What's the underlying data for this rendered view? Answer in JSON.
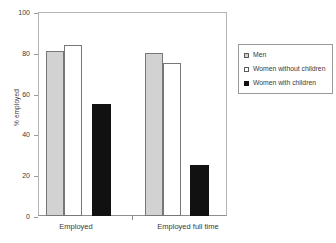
{
  "chart_data": {
    "type": "bar",
    "title": "",
    "xlabel": "",
    "ylabel": "% employed",
    "ylim": [
      0,
      100
    ],
    "yticks": [
      0,
      20,
      40,
      60,
      80,
      100
    ],
    "grid": false,
    "legend_position": "right",
    "categories": [
      "Employed",
      "Employed full time"
    ],
    "series": [
      {
        "name": "Men",
        "color": "#d2d2d2",
        "values": [
          81,
          80
        ]
      },
      {
        "name": "Women without children",
        "color": "#ffffff",
        "values": [
          84,
          75
        ]
      },
      {
        "name": "Women with children",
        "color": "#111111",
        "values": [
          55,
          25
        ]
      }
    ]
  },
  "axis": {
    "y_title": "% employed",
    "y_ticks": [
      "0",
      "20",
      "40",
      "60",
      "80",
      "100"
    ],
    "x_labels": [
      "Employed",
      "Employed full time"
    ]
  },
  "legend": {
    "items": [
      {
        "label": "Men",
        "swatch": "legend-swatch-gray"
      },
      {
        "label": "Women without children",
        "swatch": "legend-swatch-white"
      },
      {
        "label": "Women with children",
        "swatch": "legend-swatch-black"
      }
    ]
  }
}
